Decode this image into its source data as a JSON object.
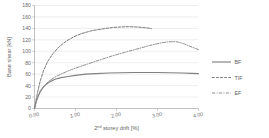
{
  "chart_data": {
    "type": "line",
    "title": "",
    "xlabel": "2nd storey drift [%]",
    "xlabel_base": "2",
    "xlabel_sup": "nd",
    "xlabel_rest": " storey drift [%]",
    "ylabel": "Base shear [kN]",
    "xlim": [
      0.0,
      4.0
    ],
    "ylim": [
      0,
      180
    ],
    "xticks": [
      "0.00",
      "1.00",
      "2.00",
      "3.00",
      "4.00"
    ],
    "xtick_values": [
      0.0,
      1.0,
      2.0,
      3.0,
      4.0
    ],
    "yticks": [
      "0",
      "20",
      "40",
      "60",
      "80",
      "100",
      "120",
      "140",
      "160",
      "180"
    ],
    "ytick_values": [
      0,
      20,
      40,
      60,
      80,
      100,
      120,
      140,
      160,
      180
    ],
    "grid": "horizontal",
    "grid_color": "#e3e3e3",
    "axis_color": "#a6a6a6",
    "legend_position": "right",
    "series": [
      {
        "name": "BF",
        "style": "solid",
        "color": "#808080",
        "x": [
          0.0,
          0.04,
          0.09,
          0.14,
          0.2,
          0.28,
          0.38,
          0.5,
          0.65,
          0.82,
          1.0,
          1.25,
          1.5,
          1.8,
          2.1,
          2.4,
          2.7,
          3.0,
          3.3,
          3.6,
          3.85,
          4.0
        ],
        "y": [
          0,
          12,
          22,
          30,
          36,
          42,
          47,
          51,
          54,
          56,
          58,
          60,
          61,
          62,
          62.5,
          63,
          63,
          63,
          62.5,
          62,
          61.5,
          61
        ]
      },
      {
        "name": "TIF",
        "style": "dashed",
        "color": "#707070",
        "x": [
          0.0,
          0.04,
          0.08,
          0.14,
          0.22,
          0.32,
          0.45,
          0.6,
          0.78,
          0.95,
          1.15,
          1.4,
          1.65,
          1.9,
          2.1,
          2.3,
          2.5,
          2.65,
          2.78,
          2.85
        ],
        "y": [
          0,
          16,
          30,
          48,
          66,
          82,
          96,
          108,
          118,
          125,
          131,
          136,
          139,
          141.5,
          142.5,
          143,
          142.5,
          141.5,
          140.5,
          139.5
        ]
      },
      {
        "name": "EF",
        "style": "dashdot",
        "color": "#8a8a8a",
        "x": [
          0.0,
          0.05,
          0.12,
          0.22,
          0.35,
          0.5,
          0.7,
          0.9,
          1.1,
          1.35,
          1.6,
          1.9,
          2.2,
          2.5,
          2.8,
          3.05,
          3.25,
          3.45,
          3.65,
          3.85,
          4.0
        ],
        "y": [
          0,
          14,
          26,
          38,
          48,
          55,
          62,
          68,
          73,
          79,
          85,
          92,
          98,
          104,
          110,
          114,
          116.5,
          117,
          113,
          107,
          103
        ]
      }
    ]
  },
  "legend": {
    "items": [
      {
        "label": "BF",
        "style": "solid"
      },
      {
        "label": "TIF",
        "style": "dashed"
      },
      {
        "label": "EF",
        "style": "dashdot"
      }
    ]
  }
}
